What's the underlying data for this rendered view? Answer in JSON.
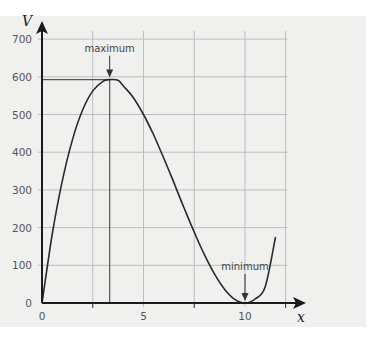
{
  "chart_data": {
    "type": "line",
    "title": "",
    "xlabel": "x",
    "ylabel": "V",
    "xlim": [
      0,
      13
    ],
    "ylim": [
      0,
      700
    ],
    "grid": true,
    "x_ticks": [
      0,
      5,
      10
    ],
    "x_tick_labels": [
      "0",
      "5",
      "10"
    ],
    "x_gridlines": [
      2.5,
      5,
      7.5,
      10,
      12
    ],
    "y_ticks": [
      0,
      100,
      200,
      300,
      400,
      500,
      600,
      700
    ],
    "y_tick_labels": [
      "0",
      "100",
      "200",
      "300",
      "400",
      "500",
      "600",
      "700"
    ],
    "series": [
      {
        "name": "V",
        "x": [
          0,
          0.5,
          1,
          1.5,
          2,
          2.5,
          3,
          3.333,
          3.75,
          4,
          4.5,
          5,
          5.5,
          6,
          6.5,
          7,
          7.5,
          8,
          8.5,
          9,
          9.5,
          10,
          10.5,
          11,
          11.5
        ],
        "values": [
          0,
          180.5,
          324,
          433.5,
          512,
          562.5,
          588,
          592.6,
          590.6,
          576,
          544.5,
          500,
          445.5,
          384,
          318.5,
          252,
          187.5,
          128,
          76.5,
          36,
          9.5,
          0,
          10.5,
          44,
          175
        ]
      }
    ],
    "annotations": [
      {
        "text": "maximum",
        "x": 3.333,
        "y": 592.6,
        "arrow": "down",
        "guide_lines": true
      },
      {
        "text": "minimum",
        "x": 10,
        "y": 0,
        "arrow": "down"
      }
    ]
  }
}
